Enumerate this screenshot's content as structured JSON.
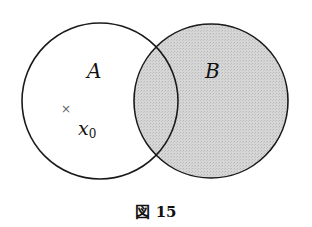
{
  "diagram": {
    "type": "venn",
    "sets": [
      {
        "label": "A",
        "shaded": false
      },
      {
        "label": "B",
        "shaded": true
      }
    ],
    "point": {
      "marker": "×",
      "label_base": "x",
      "label_sub": "0"
    },
    "caption": "図 15",
    "colors": {
      "outline": "#1a1a1a",
      "shade": "#d2d2d2",
      "background": "#ffffff"
    }
  }
}
